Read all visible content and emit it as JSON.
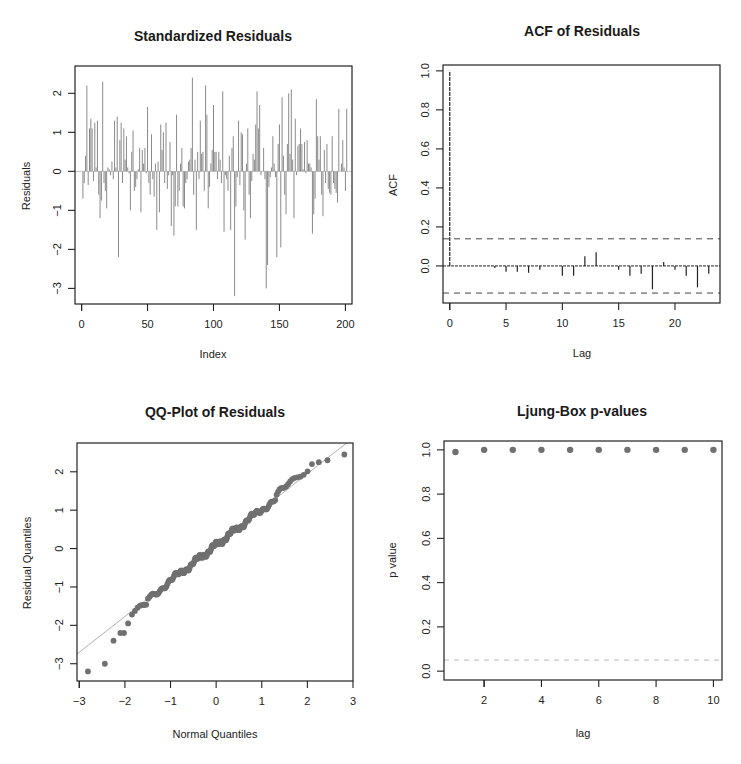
{
  "figure": {
    "width": 741,
    "height": 764,
    "colors": {
      "axis": "#222222",
      "bars": "#8a8a8a",
      "acf_spikes": "#222222",
      "bounds": "#444444",
      "points": "#707070",
      "qq_line": "#b0b0b0",
      "lb_line": "#b8b8b8",
      "background": "#ffffff"
    }
  },
  "chart_data": [
    {
      "id": "std-residuals",
      "type": "bar",
      "title": "Standardized Residuals",
      "xlabel": "Index",
      "ylabel": "Residuals",
      "xlim": [
        -5,
        205
      ],
      "ylim": [
        -3.4,
        2.7
      ],
      "xticks": [
        0,
        50,
        100,
        150,
        200
      ],
      "yticks": [
        -3,
        -2,
        -1,
        0,
        1,
        2
      ],
      "grid": false,
      "reference_line": {
        "y": 0
      },
      "x_start": 1,
      "values": [
        -0.7,
        -0.3,
        0.4,
        2.2,
        -0.35,
        1.1,
        1.35,
        1.1,
        -0.25,
        1.25,
        0.1,
        1.3,
        -0.6,
        -1.2,
        -0.75,
        2.3,
        -0.3,
        -0.5,
        -0.95,
        0.1,
        0.05,
        -0.1,
        0.25,
        -0.2,
        1.3,
        0.1,
        1.4,
        -2.2,
        0.8,
        1.25,
        -0.3,
        1.1,
        0.3,
        0.9,
        0.1,
        -0.05,
        -1.0,
        0.5,
        1.05,
        -0.5,
        -0.4,
        -0.2,
        0.05,
        0.6,
        -1.05,
        0.55,
        0.2,
        0.6,
        -0.05,
        1.65,
        -0.3,
        -0.6,
        0.95,
        -0.2,
        -0.65,
        0.2,
        -1.5,
        0.25,
        -1.05,
        1.2,
        0.55,
        1.0,
        -0.3,
        1.25,
        -0.45,
        -0.1,
        0.75,
        -1.4,
        -0.1,
        -1.65,
        -0.9,
        1.45,
        -0.9,
        -0.5,
        0.2,
        0.6,
        -0.9,
        -0.95,
        -0.3,
        -0.2,
        0.25,
        0.3,
        0.6,
        2.4,
        -0.6,
        0.3,
        -1.5,
        0.5,
        -0.2,
        1.3,
        0.45,
        0.5,
        -0.5,
        2.2,
        1.45,
        -0.95,
        -0.4,
        0.2,
        0.55,
        1.7,
        0.5,
        0.5,
        -0.2,
        0.5,
        0.3,
        -0.3,
        2.05,
        -1.55,
        -0.1,
        -0.2,
        -0.5,
        0.4,
        -1.5,
        0.6,
        0.9,
        -3.2,
        -0.9,
        -0.15,
        1.3,
        -0.35,
        1.0,
        0.95,
        -1.0,
        -1.75,
        0.2,
        1.1,
        -0.6,
        -1.2,
        -0.25,
        0.45,
        0.3,
        1.2,
        2.05,
        1.1,
        1.7,
        -0.1,
        0.0,
        0.6,
        -0.2,
        -3.0,
        -2.4,
        -0.4,
        -0.15,
        0.1,
        0.9,
        0.2,
        -0.15,
        -2.2,
        0.7,
        1.2,
        -1.95,
        1.9,
        0.4,
        -0.6,
        -1.1,
        0.7,
        2.0,
        0.45,
        2.1,
        0.3,
        -1.2,
        1.35,
        -0.1,
        0.65,
        0.7,
        1.1,
        0.7,
        0.05,
        0.75,
        -0.05,
        0.8,
        0.2,
        0.2,
        0.1,
        -1.6,
        -1.1,
        -0.7,
        1.85,
        0.9,
        0.3,
        0.9,
        -0.6,
        -1.15,
        0.55,
        -0.3,
        0.7,
        -0.45,
        -0.55,
        -0.6,
        0.9,
        -0.3,
        -0.45,
        -0.55,
        -0.8,
        1.6,
        0.0,
        0.2,
        0.8,
        0.1,
        -0.5,
        1.6
      ]
    },
    {
      "id": "acf-residuals",
      "type": "bar",
      "title": "ACF of Residuals",
      "xlabel": "Lag",
      "ylabel": "ACF",
      "xlim": [
        -0.6,
        24
      ],
      "ylim": [
        -0.19,
        1.03
      ],
      "xticks": [
        0,
        5,
        10,
        15,
        20
      ],
      "yticks": [
        0.0,
        0.2,
        0.4,
        0.6,
        0.8,
        1.0
      ],
      "grid": false,
      "lags": [
        0,
        1,
        2,
        3,
        4,
        5,
        6,
        7,
        8,
        9,
        10,
        11,
        12,
        13,
        14,
        15,
        16,
        17,
        18,
        19,
        20,
        21,
        22,
        23
      ],
      "values": [
        1.0,
        0.0,
        0.0,
        0.0,
        -0.01,
        -0.03,
        -0.03,
        -0.035,
        -0.02,
        0.0,
        -0.05,
        -0.05,
        0.05,
        0.07,
        0.0,
        -0.02,
        -0.05,
        -0.04,
        -0.12,
        0.02,
        -0.02,
        -0.05,
        -0.11,
        -0.04
      ],
      "confidence_bounds": [
        -0.139,
        0.139
      ],
      "reference_line": {
        "y": 0
      }
    },
    {
      "id": "qq-residuals",
      "type": "scatter",
      "title": "QQ-Plot of Residuals",
      "xlabel": "Normal Quantiles",
      "ylabel": "Residual Quantiles",
      "xlim": [
        -3.05,
        3.0
      ],
      "ylim": [
        -3.45,
        2.75
      ],
      "xticks": [
        -3,
        -2,
        -1,
        0,
        1,
        2,
        3
      ],
      "yticks": [
        -3,
        -2,
        -1,
        0,
        1,
        2
      ],
      "grid": false,
      "reference_line": {
        "intercept": 0.09,
        "slope": 0.93
      },
      "tails": {
        "lower": [
          [
            -2.81,
            -3.2
          ],
          [
            -2.44,
            -3.0
          ],
          [
            -2.25,
            -2.4
          ],
          [
            -2.1,
            -2.2
          ],
          [
            -2.02,
            -2.2
          ],
          [
            -1.93,
            -1.95
          ]
        ],
        "upper": [
          [
            2.1,
            2.2
          ],
          [
            2.25,
            2.25
          ],
          [
            2.44,
            2.3
          ],
          [
            2.81,
            2.45
          ]
        ]
      },
      "n_points": 200
    },
    {
      "id": "ljung-box",
      "type": "scatter",
      "title": "Ljung-Box p-values",
      "xlabel": "lag",
      "ylabel": "p value",
      "xlim": [
        0.6,
        10.3
      ],
      "ylim": [
        -0.04,
        1.04
      ],
      "xticks": [
        2,
        4,
        6,
        8,
        10
      ],
      "yticks": [
        0.0,
        0.2,
        0.4,
        0.6,
        0.8,
        1.0
      ],
      "grid": false,
      "x": [
        1,
        2,
        3,
        4,
        5,
        6,
        7,
        8,
        9,
        10
      ],
      "values": [
        0.99,
        1.0,
        1.0,
        1.0,
        1.0,
        1.0,
        1.0,
        1.0,
        1.0,
        1.0
      ],
      "reference_line": {
        "y": 0.05,
        "style": "dashed"
      }
    }
  ]
}
